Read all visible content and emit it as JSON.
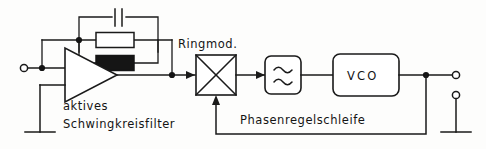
{
  "diagram": {
    "background_color": "#fdfdfc",
    "ink_color": "#1a1a1a",
    "labels": {
      "filter_line1": "aktives",
      "filter_line2": "Schwingkreisfilter",
      "ringmod": "Ringmod.",
      "vco": "VCO",
      "loop": "Phasenregelschleife"
    },
    "blocks": [
      {
        "id": "amplifier",
        "name": "aktives Schwingkreisfilter",
        "symbol": "triangle-amplifier",
        "caption": "aktives\nSchwingkreisfilter"
      },
      {
        "id": "ringmodulator",
        "name": "Ringmod.",
        "symbol": "crossed-square",
        "caption": "Ringmod."
      },
      {
        "id": "lowpass",
        "name": "Tiefpass",
        "symbol": "double-sine",
        "caption": ""
      },
      {
        "id": "vco",
        "name": "VCO",
        "symbol": "rounded-box-text",
        "caption": "VCO"
      }
    ],
    "feedback_components": [
      {
        "id": "capacitor",
        "symbol": "capacitor-plates",
        "fill": "none"
      },
      {
        "id": "resistor-open",
        "symbol": "rectangle-resistor",
        "fill": "#ffffff"
      },
      {
        "id": "resistor-filled",
        "symbol": "rectangle-resistor",
        "fill": "#151515"
      }
    ],
    "terminals": [
      {
        "id": "input-terminal",
        "type": "open-circle",
        "position": "left"
      },
      {
        "id": "output-terminal-hot",
        "type": "open-circle",
        "position": "right-top"
      },
      {
        "id": "output-terminal-ground",
        "type": "open-circle",
        "position": "right-bottom"
      }
    ],
    "grounds": [
      {
        "id": "ground-amplifier",
        "symbol": "ground-bar"
      },
      {
        "id": "ground-output",
        "symbol": "ground-bar"
      }
    ]
  }
}
